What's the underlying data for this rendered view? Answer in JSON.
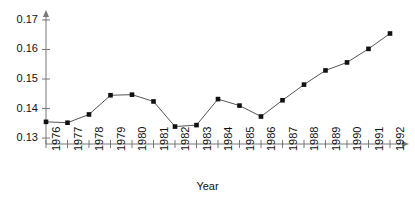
{
  "chart_data": {
    "type": "line",
    "title": "",
    "subtitle": "",
    "xlabel": "Year",
    "ylabel": "",
    "categories": [
      "1976",
      "1977",
      "1978",
      "1979",
      "1980",
      "1981",
      "1982",
      "1983",
      "1984",
      "1985",
      "1986",
      "1987",
      "1988",
      "1989",
      "1990",
      "1991",
      "1992"
    ],
    "x": [
      1976,
      1977,
      1978,
      1979,
      1980,
      1981,
      1982,
      1983,
      1984,
      1985,
      1986,
      1987,
      1988,
      1989,
      1990,
      1991,
      1992
    ],
    "values": [
      0.1355,
      0.1352,
      0.138,
      0.1445,
      0.1447,
      0.1424,
      0.1339,
      0.1344,
      0.1432,
      0.141,
      0.1373,
      0.1428,
      0.1481,
      0.1529,
      0.1556,
      0.1602,
      0.1654
    ],
    "series": [
      {
        "name": "",
        "values": [
          0.1355,
          0.1352,
          0.138,
          0.1445,
          0.1447,
          0.1424,
          0.1339,
          0.1344,
          0.1432,
          0.141,
          0.1373,
          0.1428,
          0.1481,
          0.1529,
          0.1556,
          0.1602,
          0.1654
        ]
      }
    ],
    "ylim": [
      0.128,
      0.172
    ],
    "yticks": [
      0.13,
      0.14,
      0.15,
      0.16,
      0.17
    ],
    "ytick_labels": [
      "0.13",
      "0.14",
      "0.15",
      "0.16",
      "0.17"
    ],
    "xtick_labels": [
      "1976",
      "1977",
      "1978",
      "1979",
      "1980",
      "1981",
      "1982",
      "1983",
      "1984",
      "1985",
      "1986",
      "1987",
      "1988",
      "1989",
      "1990",
      "1991",
      "1992"
    ],
    "grid": false,
    "legend": false,
    "legend_position": "none",
    "marker": "square",
    "line_color": "#555555",
    "marker_color": "#111111",
    "axis_color": "#777777",
    "background_color": "#ffffff",
    "annotations": []
  }
}
